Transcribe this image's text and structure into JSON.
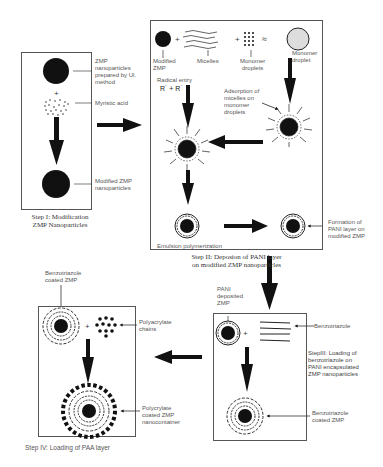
{
  "diagram": {
    "title": "",
    "step1": {
      "caption": "Step I: Modification\nZMP Nanoparticles",
      "labels": {
        "zmp_np": "ZMP\nnanoparticles\nprepared by Ul.\nmethod",
        "myristic": "Myristic acid",
        "modified": "Modified ZMP\nnanoparticles"
      }
    },
    "step2": {
      "caption": "Step II: Deposion of PANI layer\non modified ZMP nanoparticles",
      "labels": {
        "modified_zmp": "Modified\nZMP",
        "micelles": "Micelles",
        "monomer_droplets": "Monomer\ndroplets",
        "monomer_droplet": "Monomer\ndroplet",
        "radical_entry": "Radical entry",
        "radical_formula": "R˙ + R˙",
        "adsorption": "Adsorption of\nmicelles on\nmonomer\ndroplets",
        "emulsion": "Emulsion polymerization",
        "formation": "Formation of\nPANI layer on\nmodified ZMP"
      }
    },
    "step3": {
      "caption": "StepIII: Loading of\nbenzotriazole on\nPANI encapsulated\nZMP nanoparticles",
      "labels": {
        "pani_deposited": "PANI\ndeposited\nZMP",
        "benzotriazole": "Benzotriazole",
        "bzt_coated": "Benzotriazole\ncoated ZMP"
      }
    },
    "step4": {
      "caption": "Step IV: Loading of PAA layer",
      "labels": {
        "bzt_coated": "Benzotriazole\ncoated ZMP",
        "polyacrylate": "Polyacrylate\nchains",
        "nanocontainer": "Polycrylate\ncoated ZMP\nnanocontainer"
      }
    },
    "colors": {
      "ink": "#111111",
      "border": "#555555",
      "text": "#555555",
      "droplet": "#dddddd"
    }
  }
}
